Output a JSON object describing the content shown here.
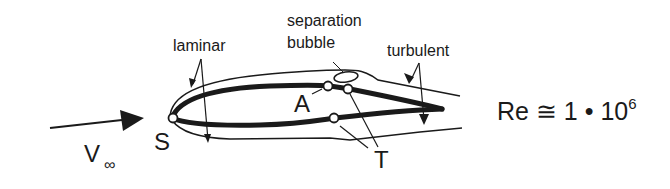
{
  "diagram": {
    "type": "airfoil boundary layer transition sketch",
    "labels": {
      "laminar": "laminar",
      "separation_line1": "separation",
      "separation_line2": "bubble",
      "turbulent": "turbulent",
      "point_A": "A",
      "point_S": "S",
      "point_T": "T",
      "freestream_V": "V",
      "freestream_sub": "∞",
      "reynolds_prefix": "Re ≅ 1 • 10",
      "reynolds_exp": "6"
    },
    "points": [
      {
        "id": "S",
        "meaning": "stagnation point"
      },
      {
        "id": "A",
        "meaning": "separation point"
      },
      {
        "id": "T",
        "meaning": "transition points (upper and lower surface)"
      }
    ],
    "colors": {
      "stroke": "#1a1a1a",
      "background": "#ffffff"
    }
  }
}
